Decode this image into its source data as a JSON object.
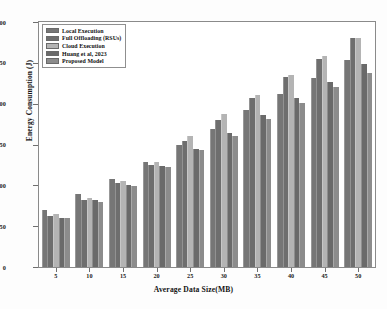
{
  "chart_data": {
    "type": "bar",
    "title": "",
    "xlabel": "Average Data Size(MB)",
    "ylabel": "Energy Consumption (J)",
    "categories": [
      "5",
      "10",
      "15",
      "20",
      "25",
      "30",
      "35",
      "40",
      "45",
      "50"
    ],
    "ylim": [
      0,
      300
    ],
    "yticks": [
      "0",
      "50",
      "100",
      "150",
      "200",
      "250",
      "300"
    ],
    "grid": false,
    "legend_position": "upper left",
    "series": [
      {
        "name": "Local Execution",
        "color": "#767676",
        "values": [
          70,
          90,
          108,
          128,
          150,
          169,
          192,
          212,
          232,
          253
        ]
      },
      {
        "name": "Full Offloading (RSUs)",
        "color": "#6e6e6e",
        "values": [
          62,
          82,
          103,
          125,
          154,
          180,
          207,
          233,
          255,
          281
        ]
      },
      {
        "name": "Cloud Execution",
        "color": "#b4b4b4",
        "values": [
          65,
          85,
          105,
          129,
          160,
          187,
          211,
          235,
          258,
          281
        ]
      },
      {
        "name": "Huang et al, 2023",
        "color": "#6a6a6a",
        "values": [
          60,
          82,
          101,
          124,
          145,
          164,
          186,
          207,
          227,
          248
        ]
      },
      {
        "name": "Proposed Model",
        "color": "#8c8c8c",
        "values": [
          60,
          80,
          99,
          122,
          143,
          161,
          181,
          201,
          220,
          238
        ]
      }
    ]
  }
}
